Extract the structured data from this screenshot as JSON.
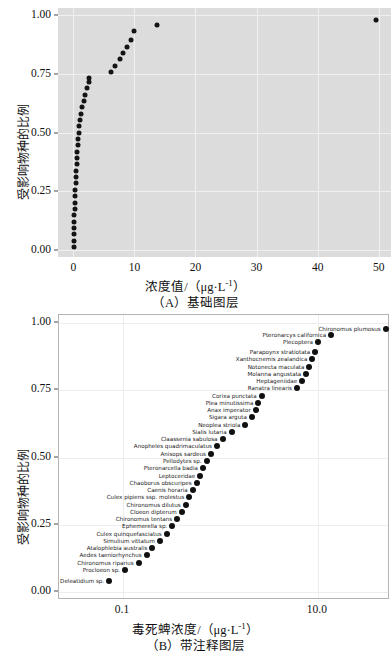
{
  "figure": {
    "panels": [
      {
        "id": "A",
        "caption": "（A）基础图层",
        "xlabel": "浓度值/（μg·L",
        "xlabel_sup": "-1",
        "xlabel_tail": "）",
        "ylabel": "受影响物种的比例"
      },
      {
        "id": "B",
        "caption": "（B）带注释图层",
        "xlabel": "毒死蜱浓度/（μg·L",
        "xlabel_sup": "-1",
        "xlabel_tail": "）",
        "ylabel": "受影响物种的比例"
      }
    ]
  },
  "chart_data": [
    {
      "type": "scatter",
      "title": "（A）基础图层",
      "xlabel": "浓度值/（μg·L-1）",
      "ylabel": "受影响物种的比例",
      "xlim": [
        -2.5,
        52
      ],
      "ylim": [
        -0.03,
        1.03
      ],
      "xticks": [
        0,
        10,
        20,
        30,
        40,
        50
      ],
      "xticklabels": [
        "0",
        "10",
        "20",
        "30",
        "40",
        "50"
      ],
      "yticks": [
        0.0,
        0.25,
        0.5,
        0.75,
        1.0
      ],
      "yticklabels": [
        "0.00",
        "0.25",
        "0.50",
        "0.75",
        "1.00"
      ],
      "grid": true,
      "panel_background": "#dcdcdc",
      "marker_color": "#141414",
      "x": [
        0.06,
        0.08,
        0.1,
        0.12,
        0.15,
        0.18,
        0.22,
        0.26,
        0.3,
        0.35,
        0.4,
        0.45,
        0.5,
        0.55,
        0.62,
        0.68,
        0.75,
        0.82,
        0.9,
        1.0,
        1.1,
        1.25,
        1.45,
        1.7,
        2.0,
        2.3,
        2.6,
        2.65,
        6.1,
        6.9,
        7.6,
        8.2,
        8.8,
        9.4,
        10.0,
        13.7,
        49.6
      ],
      "y": [
        0.013,
        0.04,
        0.067,
        0.094,
        0.121,
        0.148,
        0.175,
        0.202,
        0.229,
        0.256,
        0.283,
        0.31,
        0.337,
        0.364,
        0.391,
        0.418,
        0.445,
        0.472,
        0.499,
        0.526,
        0.553,
        0.58,
        0.607,
        0.634,
        0.661,
        0.688,
        0.715,
        0.73,
        0.757,
        0.784,
        0.811,
        0.838,
        0.865,
        0.892,
        0.93,
        0.957,
        0.978
      ]
    },
    {
      "type": "scatter",
      "title": "（B）带注释图层",
      "xlabel": "毒死蜱浓度/（μg·L-1）",
      "ylabel": "受影响物种的比例",
      "xscale": "log",
      "xlim": [
        0.022,
        55
      ],
      "ylim": [
        -0.03,
        1.03
      ],
      "xticks": [
        0.1,
        10.0
      ],
      "xticklabels": [
        "0.1",
        "10.0"
      ],
      "yticks": [
        0.0,
        0.25,
        0.5,
        0.75,
        1.0
      ],
      "yticklabels": [
        "0.00",
        "0.25",
        "0.50",
        "0.75",
        "1.00"
      ],
      "grid": true,
      "panel_background": "#ffffff",
      "marker_color": "#101010",
      "points": [
        {
          "label": "Chironomus plumosus",
          "x": 49.6,
          "y": 0.978
        },
        {
          "label": "Pteronarcys californica",
          "x": 13.7,
          "y": 0.957
        },
        {
          "label": "Plecoptera",
          "x": 10.0,
          "y": 0.93
        },
        {
          "label": "Parapoynx stratiotata",
          "x": 9.4,
          "y": 0.892
        },
        {
          "label": "Xanthocnemis zealandica",
          "x": 8.8,
          "y": 0.865
        },
        {
          "label": "Notonecta maculata",
          "x": 8.2,
          "y": 0.838
        },
        {
          "label": "Molanna angustata",
          "x": 7.6,
          "y": 0.811
        },
        {
          "label": "Heptageniidae",
          "x": 6.9,
          "y": 0.784
        },
        {
          "label": "Ranatra linearis",
          "x": 6.1,
          "y": 0.757
        },
        {
          "label": "Corixa punctata",
          "x": 2.65,
          "y": 0.73
        },
        {
          "label": "Plea minutissima",
          "x": 2.45,
          "y": 0.703
        },
        {
          "label": "Anax imperator",
          "x": 2.3,
          "y": 0.676
        },
        {
          "label": "Sigara arguta",
          "x": 2.1,
          "y": 0.649
        },
        {
          "label": "Neoplea striola",
          "x": 1.8,
          "y": 0.622
        },
        {
          "label": "Sialis lutaria",
          "x": 1.3,
          "y": 0.595
        },
        {
          "label": "Claassenia sabulosa",
          "x": 1.05,
          "y": 0.568
        },
        {
          "label": "Anopheles quadrimaculatus",
          "x": 0.92,
          "y": 0.541
        },
        {
          "label": "Anisops sardeus",
          "x": 0.8,
          "y": 0.514
        },
        {
          "label": "Pellodytes sp.",
          "x": 0.72,
          "y": 0.487
        },
        {
          "label": "Pteronarcella badia",
          "x": 0.66,
          "y": 0.46
        },
        {
          "label": "Leptoceridae",
          "x": 0.62,
          "y": 0.433
        },
        {
          "label": "Chaoborus obscuripes",
          "x": 0.57,
          "y": 0.406
        },
        {
          "label": "Caenis horaria",
          "x": 0.52,
          "y": 0.379
        },
        {
          "label": "Culex pipiens ssp. molestus",
          "x": 0.48,
          "y": 0.352
        },
        {
          "label": "Chironomus dilutus",
          "x": 0.44,
          "y": 0.325
        },
        {
          "label": "Cloeon dipterum",
          "x": 0.4,
          "y": 0.298
        },
        {
          "label": "Chironomus tentans",
          "x": 0.36,
          "y": 0.271
        },
        {
          "label": "Ephemerella sp.",
          "x": 0.32,
          "y": 0.244
        },
        {
          "label": "Culex quinquefasciatus",
          "x": 0.28,
          "y": 0.217
        },
        {
          "label": "Simulium vittatum",
          "x": 0.24,
          "y": 0.19
        },
        {
          "label": "Atalophlebia australis",
          "x": 0.2,
          "y": 0.163
        },
        {
          "label": "Aedes taeniorhynchus",
          "x": 0.175,
          "y": 0.136
        },
        {
          "label": "Chironomus riparius",
          "x": 0.145,
          "y": 0.109
        },
        {
          "label": "Procloeon sp.",
          "x": 0.105,
          "y": 0.082
        },
        {
          "label": "Deleatidium sp.",
          "x": 0.072,
          "y": 0.04
        }
      ]
    }
  ]
}
